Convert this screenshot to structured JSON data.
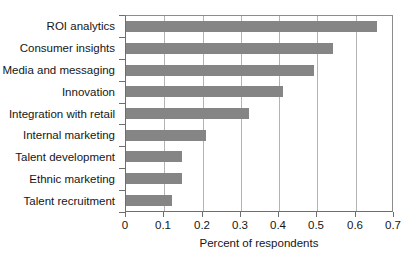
{
  "chart_data": {
    "type": "bar",
    "orientation": "horizontal",
    "title": "",
    "xlabel": "Percent of respondents",
    "ylabel": "",
    "xlim": [
      0,
      0.7
    ],
    "xticks": [
      "0",
      "0.1",
      "0.2",
      "0.3",
      "0.4",
      "0.5",
      "0.6",
      "0.7"
    ],
    "xtick_values": [
      0,
      0.1,
      0.2,
      0.3,
      0.4,
      0.5,
      0.6,
      0.7
    ],
    "grid": "vertical",
    "legend": "none",
    "bar_color": "#858585",
    "categories": [
      "ROI analytics",
      "Consumer insights",
      "Media and messaging",
      "Innovation",
      "Integration with retail",
      "Internal marketing",
      "Talent development",
      "Ethnic marketing",
      "Talent recruitment"
    ],
    "values": [
      0.655,
      0.54,
      0.49,
      0.41,
      0.32,
      0.21,
      0.145,
      0.145,
      0.12
    ]
  }
}
